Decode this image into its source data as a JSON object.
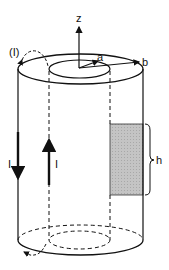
{
  "diagram": {
    "labels": {
      "z_axis": "z",
      "inner_radius": "a",
      "outer_radius": "b",
      "loop": "(I)",
      "current_outer": "I",
      "current_inner": "I",
      "height": "h"
    },
    "colors": {
      "stroke": "#111111",
      "shade": "#bdbdbd",
      "background": "#ffffff"
    }
  }
}
